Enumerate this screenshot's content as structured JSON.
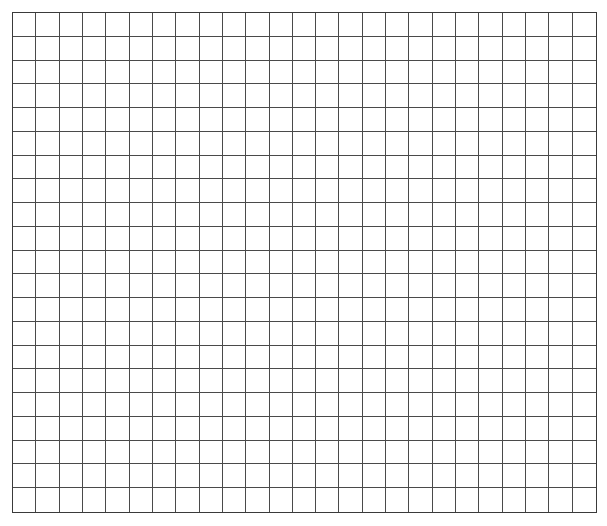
{
  "grid": {
    "columns": 25,
    "rows": 21,
    "line_color": "#4a4a4a",
    "border_color": "#3a3a3a",
    "background": "#ffffff"
  }
}
